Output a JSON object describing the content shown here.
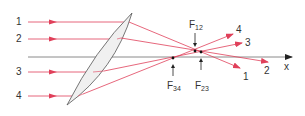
{
  "diagram": {
    "colors": {
      "ray": "#e0405a",
      "axis": "#8a8a8a",
      "lens_fill": "#f0f0f0",
      "lens_stroke": "#555555",
      "text": "#333333",
      "focus_dot": "#111111"
    },
    "rays": [
      {
        "id": "1",
        "in_label": "1",
        "out_label": "1"
      },
      {
        "id": "2",
        "in_label": "2",
        "out_label": "2"
      },
      {
        "id": "3",
        "in_label": "3",
        "out_label": "3"
      },
      {
        "id": "4",
        "in_label": "4",
        "out_label": "4"
      }
    ],
    "axis": {
      "label": "x"
    },
    "focal_points": [
      {
        "id": "F12",
        "main": "F",
        "sub": "12"
      },
      {
        "id": "F23",
        "main": "F",
        "sub": "23"
      },
      {
        "id": "F34",
        "main": "F",
        "sub": "34"
      }
    ]
  }
}
